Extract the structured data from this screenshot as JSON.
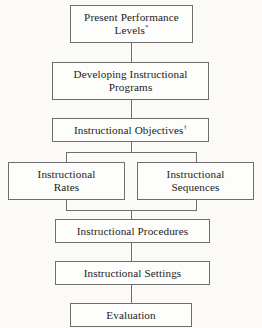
{
  "diagram": {
    "type": "flowchart",
    "orientation": "vertical",
    "style": {
      "background_color": "#fbfaf7",
      "node_fill": "#fdfdfb",
      "border_color": "#6e6e6e",
      "text_color": "#1c1c1c"
    },
    "nodes": [
      {
        "id": "present-performance-levels",
        "text": "Present Performance Levels",
        "superscript": "*",
        "lines": [
          "Present Performance",
          "Levels"
        ],
        "level": 1
      },
      {
        "id": "developing-instructional-programs",
        "text": "Developing Instructional Programs",
        "superscript": "",
        "lines": [
          "Developing Instructional",
          "Programs"
        ],
        "level": 2
      },
      {
        "id": "instructional-objectives",
        "text": "Instructional Objectives",
        "superscript": "†",
        "lines": [
          "Instructional Objectives"
        ],
        "level": 3
      },
      {
        "id": "instructional-rates",
        "text": "Instructional Rates",
        "superscript": "",
        "lines": [
          "Instructional",
          "Rates"
        ],
        "level": 4
      },
      {
        "id": "instructional-sequences",
        "text": "Instructional Sequences",
        "superscript": "",
        "lines": [
          "Instructional",
          "Sequences"
        ],
        "level": 4
      },
      {
        "id": "instructional-procedures",
        "text": "Instructional Procedures",
        "superscript": "",
        "lines": [
          "Instructional Procedures"
        ],
        "level": 5
      },
      {
        "id": "instructional-settings",
        "text": "Instructional Settings",
        "superscript": "",
        "lines": [
          "Instructional Settings"
        ],
        "level": 6
      },
      {
        "id": "evaluation",
        "text": "Evaluation",
        "superscript": "",
        "lines": [
          "Evaluation"
        ],
        "level": 7
      }
    ],
    "edges": [
      {
        "from": "present-performance-levels",
        "to": "developing-instructional-programs"
      },
      {
        "from": "developing-instructional-programs",
        "to": "instructional-objectives"
      },
      {
        "from": "instructional-objectives",
        "to": "instructional-rates"
      },
      {
        "from": "instructional-objectives",
        "to": "instructional-sequences"
      },
      {
        "from": "instructional-rates",
        "to": "instructional-procedures"
      },
      {
        "from": "instructional-sequences",
        "to": "instructional-procedures"
      },
      {
        "from": "instructional-procedures",
        "to": "instructional-settings"
      },
      {
        "from": "instructional-settings",
        "to": "evaluation"
      }
    ],
    "footnote_markers": [
      "*",
      "†"
    ]
  }
}
